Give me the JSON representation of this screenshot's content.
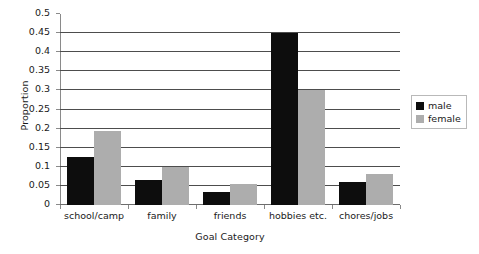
{
  "chart_data": {
    "type": "bar",
    "title": "",
    "xlabel": "Goal Category",
    "ylabel": "Proportion",
    "categories": [
      "school/camp",
      "family",
      "friends",
      "hobbies etc.",
      "chores/jobs"
    ],
    "series": [
      {
        "name": "male",
        "color": "#0d0d0d",
        "values": [
          0.127,
          0.066,
          0.034,
          0.45,
          0.059
        ]
      },
      {
        "name": "female",
        "color": "#adadad",
        "values": [
          0.195,
          0.099,
          0.056,
          0.3,
          0.081
        ]
      }
    ],
    "ylim": [
      0,
      0.5
    ],
    "ytick_labels": [
      "0",
      "0.05",
      "0.1",
      "0.15",
      "0.2",
      "0.25",
      "0.3",
      "0.35",
      "0.4",
      "0.45",
      "0.5"
    ],
    "ytick_values": [
      0,
      0.05,
      0.1,
      0.15,
      0.2,
      0.25,
      0.3,
      0.35,
      0.4,
      0.45,
      0.5
    ],
    "gridline_values": [
      0.05,
      0.1,
      0.15,
      0.2,
      0.25,
      0.3,
      0.35,
      0.4,
      0.45
    ],
    "grid": true,
    "legend_position": "right"
  },
  "legend": {
    "entries": [
      {
        "label": "male"
      },
      {
        "label": "female"
      }
    ]
  }
}
